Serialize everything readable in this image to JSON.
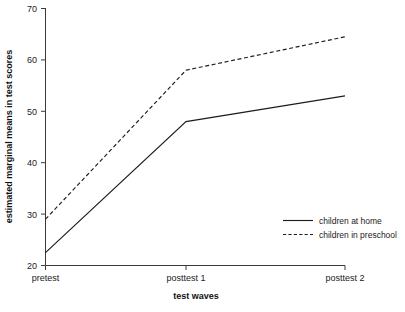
{
  "chart_data": {
    "type": "line",
    "title": "",
    "xlabel": "test waves",
    "ylabel": "estimated marginal means in test scores",
    "categories": [
      "pretest",
      "posttest 1",
      "posttest 2"
    ],
    "series": [
      {
        "name": "children at home",
        "style": "solid",
        "values": [
          22.5,
          48,
          53
        ]
      },
      {
        "name": "children in preschool",
        "style": "dashed",
        "values": [
          29,
          58,
          64.5
        ]
      }
    ],
    "ylim": [
      20,
      70
    ],
    "yticks": [
      20,
      30,
      40,
      50,
      60,
      70
    ],
    "ytick_labels": [
      "20",
      "30",
      "40",
      "50",
      "60",
      "70"
    ],
    "xtick_labels": [
      "pretest",
      "posttest 1",
      "posttest 2"
    ],
    "grid": false,
    "legend_position": "bottom-right",
    "legend_frame": false,
    "colors": {
      "series": "#1d1d1d",
      "axis": "#3b3b3b",
      "background": "#ffffff"
    }
  },
  "axis": {
    "y_title": "estimated marginal means in test scores",
    "x_title": "test waves",
    "y_tick_0": "20",
    "y_tick_1": "30",
    "y_tick_2": "40",
    "y_tick_3": "50",
    "y_tick_4": "60",
    "y_tick_5": "70",
    "x_tick_0": "pretest",
    "x_tick_1": "posttest 1",
    "x_tick_2": "posttest 2"
  },
  "legend": {
    "entry_0_label": "children at home",
    "entry_1_label": "children in preschool"
  }
}
